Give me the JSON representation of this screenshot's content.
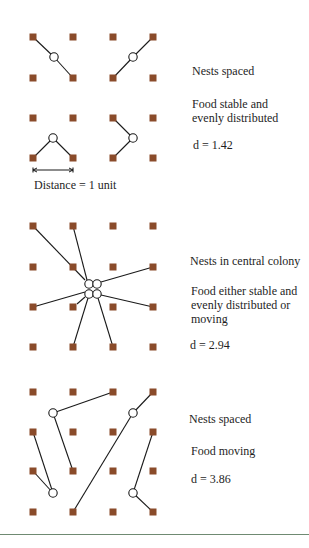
{
  "colors": {
    "food_square": "#8a4b2a",
    "nest_stroke": "#1a1a1a",
    "line": "#1a1a1a",
    "rule": "#6f8a72"
  },
  "grid": {
    "x": [
      33,
      73,
      113,
      153
    ],
    "square_size": 7
  },
  "nest_radius": 4.2,
  "panels": [
    {
      "id": "spaced-stable",
      "grid_y": [
        37,
        78,
        118,
        158
      ],
      "nests": [
        [
          54,
          57
        ],
        [
          133,
          57
        ],
        [
          53,
          138
        ],
        [
          133,
          138
        ]
      ],
      "links": [
        [
          [
            54,
            57
          ],
          [
            33,
            37
          ]
        ],
        [
          [
            54,
            57
          ],
          [
            73,
            78
          ]
        ],
        [
          [
            133,
            57
          ],
          [
            153,
            37
          ]
        ],
        [
          [
            133,
            57
          ],
          [
            113,
            78
          ]
        ],
        [
          [
            53,
            138
          ],
          [
            33,
            158
          ]
        ],
        [
          [
            53,
            138
          ],
          [
            73,
            158
          ]
        ],
        [
          [
            133,
            138
          ],
          [
            113,
            118
          ]
        ],
        [
          [
            133,
            138
          ],
          [
            113,
            158
          ]
        ]
      ],
      "captions": [
        {
          "text": "Nests spaced",
          "x": 192,
          "y": 64
        },
        {
          "text": "Food stable and",
          "x": 192,
          "y": 97
        },
        {
          "text": "evenly distributed",
          "x": 192,
          "y": 111
        },
        {
          "text": "d  =  1.42",
          "x": 193,
          "y": 138
        }
      ]
    },
    {
      "id": "central-colony",
      "grid_y": [
        226,
        267,
        307,
        347
      ],
      "nests": [
        [
          89,
          284
        ],
        [
          97,
          284
        ],
        [
          89,
          294
        ],
        [
          97,
          294
        ]
      ],
      "links": [
        [
          [
            85,
            280
          ],
          [
            33,
            226
          ]
        ],
        [
          [
            87,
            280
          ],
          [
            73,
            226
          ]
        ],
        [
          [
            101,
            282
          ],
          [
            153,
            267
          ]
        ],
        [
          [
            85,
            292
          ],
          [
            33,
            307
          ]
        ],
        [
          [
            85,
            297
          ],
          [
            77,
            304
          ]
        ],
        [
          [
            88,
            298
          ],
          [
            73,
            347
          ]
        ],
        [
          [
            98,
            298
          ],
          [
            113,
            347
          ]
        ],
        [
          [
            101,
            295
          ],
          [
            153,
            307
          ]
        ]
      ],
      "captions": [
        {
          "text": "Nests in central colony",
          "x": 190,
          "y": 254
        },
        {
          "text": "Food either stable and",
          "x": 191,
          "y": 284
        },
        {
          "text": "evenly distributed or",
          "x": 191,
          "y": 298
        },
        {
          "text": "moving",
          "x": 191,
          "y": 312
        },
        {
          "text": "d = 2.94",
          "x": 190,
          "y": 338
        }
      ]
    },
    {
      "id": "spaced-moving",
      "grid_y": [
        392,
        432,
        471,
        512
      ],
      "nests": [
        [
          53,
          413
        ],
        [
          133,
          413
        ],
        [
          53,
          493
        ],
        [
          133,
          493
        ]
      ],
      "links": [
        [
          [
            53,
            413
          ],
          [
            113,
            392
          ]
        ],
        [
          [
            53,
            413
          ],
          [
            73,
            471
          ]
        ],
        [
          [
            53,
            493
          ],
          [
            33,
            432
          ]
        ],
        [
          [
            53,
            493
          ],
          [
            33,
            471
          ]
        ],
        [
          [
            133,
            413
          ],
          [
            153,
            392
          ]
        ],
        [
          [
            133,
            413
          ],
          [
            73,
            512
          ]
        ],
        [
          [
            133,
            493
          ],
          [
            153,
            432
          ]
        ],
        [
          [
            133,
            493
          ],
          [
            153,
            512
          ]
        ]
      ],
      "captions": [
        {
          "text": "Nests spaced",
          "x": 189,
          "y": 412
        },
        {
          "text": "Food moving",
          "x": 191,
          "y": 444
        },
        {
          "text": "d = 3.86",
          "x": 191,
          "y": 472
        }
      ]
    }
  ],
  "scale_bar": {
    "x1": 33,
    "x2": 73,
    "y": 170,
    "label": "Distance = 1 unit",
    "label_x": 34,
    "label_y": 178
  },
  "bottom_rule_y": 534
}
